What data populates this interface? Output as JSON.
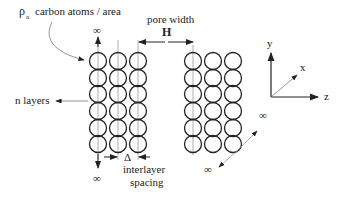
{
  "labels": {
    "density_symbol": "ρ",
    "density_sub": "a",
    "density_text": "carbon atoms / area",
    "pore_width": "pore width",
    "pore_symbol": "H",
    "n_layers": "n layers",
    "delta": "Δ",
    "interlayer_1": "interlayer",
    "interlayer_2": "spacing",
    "infinity": "∞"
  },
  "axes": {
    "y": "y",
    "x": "x",
    "z": "z"
  },
  "colors": {
    "stroke": "#222222",
    "guide": "#999999"
  }
}
